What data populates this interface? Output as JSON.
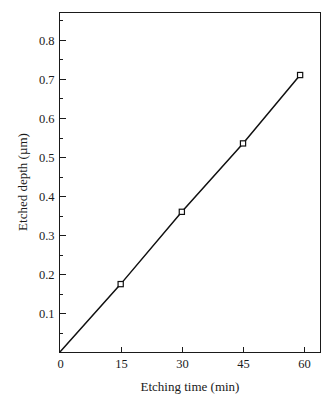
{
  "chart_data": {
    "type": "line",
    "title": "",
    "xlabel": "Etching time (min)",
    "ylabel": "Etched depth (µm)",
    "xlim": [
      0,
      64
    ],
    "ylim": [
      0,
      0.87
    ],
    "grid": false,
    "legend": null,
    "x": [
      0,
      15,
      30,
      45,
      59
    ],
    "values": [
      0,
      0.175,
      0.36,
      0.535,
      0.71
    ],
    "series": [
      {
        "name": "Etched depth",
        "x": [
          0,
          15,
          30,
          45,
          59
        ],
        "values": [
          0,
          0.175,
          0.36,
          0.535,
          0.71
        ],
        "marker": "open-square",
        "color": "#101010"
      }
    ],
    "xticks": [
      0,
      15,
      30,
      45,
      60
    ],
    "xtick_labels": [
      "0",
      "15",
      "30",
      "45",
      "60"
    ],
    "yticks": [
      0.1,
      0.2,
      0.3,
      0.4,
      0.5,
      0.6,
      0.7,
      0.8
    ],
    "ytick_labels": [
      "0.1",
      "0.2",
      "0.3",
      "0.4",
      "0.5",
      "0.6",
      "0.7",
      "0.8"
    ],
    "y_minor_ticks": [
      0.05,
      0.15,
      0.25,
      0.35,
      0.45,
      0.55,
      0.65,
      0.75,
      0.85
    ]
  },
  "axes": {
    "x_title": "Etching time (min)",
    "y_title": "Etched depth (µm)",
    "origin_label": "0"
  },
  "colors": {
    "line": "#101010",
    "axis": "#1a1a1a",
    "background": "#ffffff",
    "marker_fill": "#ffffff"
  }
}
